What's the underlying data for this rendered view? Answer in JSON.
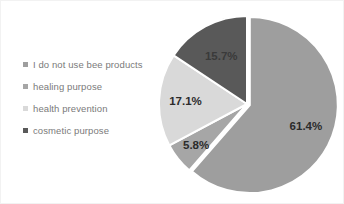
{
  "chart_data": {
    "type": "pie",
    "title": "",
    "subtitle": "",
    "xlabel": "",
    "ylabel": "",
    "legend_position": "left",
    "grid": false,
    "categories": [
      "I do not use bee products",
      "healing purpose",
      "health prevention",
      "cosmetic purpose"
    ],
    "values": [
      61.4,
      5.8,
      17.1,
      15.7
    ],
    "data_labels": [
      "61.4%",
      "5.8%",
      "17.1%",
      "15.7%"
    ],
    "units": "percent",
    "total": 100.0,
    "slices": [
      {
        "label": "I do not use bee products",
        "value": 61.4,
        "data_label": "61.4%",
        "color": "#9e9e9e"
      },
      {
        "label": "healing purpose",
        "value": 5.8,
        "data_label": "5.8%",
        "color": "#a6a6a6"
      },
      {
        "label": "health prevention",
        "value": 17.1,
        "data_label": "17.1%",
        "color": "#d9d9d9"
      },
      {
        "label": "cosmetic purpose",
        "value": 15.7,
        "data_label": "15.7%",
        "color": "#595959"
      }
    ]
  },
  "legend": {
    "items": [
      {
        "label": "I do not use bee products",
        "color": "#9e9e9e"
      },
      {
        "label": "healing purpose",
        "color": "#a6a6a6"
      },
      {
        "label": "health prevention",
        "color": "#d9d9d9"
      },
      {
        "label": "cosmetic purpose",
        "color": "#595959"
      }
    ]
  },
  "colors": {
    "background": "#ffffff",
    "slice_primary": "#9e9e9e",
    "slice_secondary": "#a6a6a6",
    "slice_light": "#d9d9d9",
    "slice_dark": "#595959",
    "label_text": "#2b2b2b",
    "legend_text": "#7a7a7a",
    "slice_border": "#ffffff"
  }
}
